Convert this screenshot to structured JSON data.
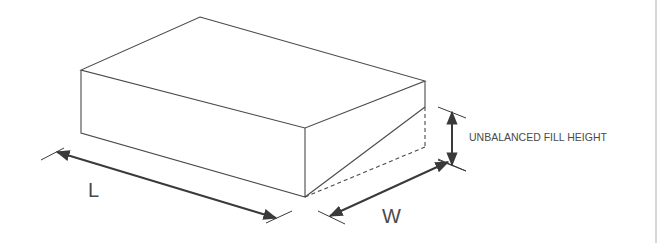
{
  "diagram": {
    "labels": {
      "length": "L",
      "width": "W",
      "height_note": "UNBALANCED FILL HEIGHT"
    },
    "colors": {
      "line": "#4a4a4a",
      "dimension": "#3a3a3a",
      "background": "#ffffff",
      "frame": "#c8c8c8"
    },
    "dimensions": [
      {
        "name": "length",
        "label": "L"
      },
      {
        "name": "width",
        "label": "W"
      },
      {
        "name": "unbalanced-fill-height",
        "label": "UNBALANCED FILL HEIGHT"
      }
    ]
  }
}
